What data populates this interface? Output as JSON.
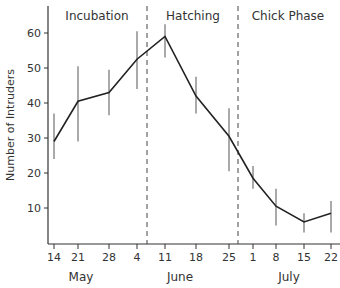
{
  "chart_data": {
    "type": "line",
    "title": "",
    "xlabel": "",
    "ylabel": "Number of Intruders",
    "ylim": [
      0,
      65
    ],
    "yticks": [
      10,
      20,
      30,
      40,
      50,
      60
    ],
    "categories": [
      "14",
      "21",
      "28",
      "4",
      "11",
      "18",
      "25",
      "1",
      "8",
      "15",
      "22"
    ],
    "months": [
      {
        "label": "May",
        "center_index": 1.5
      },
      {
        "label": "June",
        "center_index": 5
      },
      {
        "label": "July",
        "center_index": 8.5
      }
    ],
    "series": [
      {
        "name": "Number of Intruders",
        "values": [
          29,
          40.5,
          43,
          52.5,
          59,
          42,
          30.5,
          18.5,
          10.5,
          6,
          8.5
        ],
        "err_low": [
          24,
          29,
          36.5,
          44,
          53,
          37,
          20.5,
          15.5,
          5,
          3,
          3
        ],
        "err_high": [
          37,
          50.5,
          49.5,
          60.5,
          62.5,
          47.5,
          38.5,
          22,
          15.5,
          8.5,
          12
        ]
      }
    ],
    "phases": [
      {
        "label": "Incubation",
        "start_index": 0,
        "end_index": 3.4
      },
      {
        "label": "Hatching",
        "start_index": 3.4,
        "end_index": 6.7
      },
      {
        "label": "Chick Phase",
        "start_index": 6.7,
        "end_index": 10
      }
    ],
    "dividers_at_index": [
      3.4,
      6.7
    ],
    "grid": false,
    "legend": "none"
  }
}
